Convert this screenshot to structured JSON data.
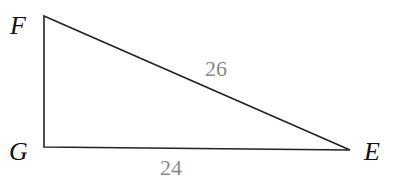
{
  "diagram": {
    "type": "right-triangle",
    "vertices": {
      "F": "F",
      "G": "G",
      "E": "E"
    },
    "right_angle_at": "G",
    "sides": {
      "FE": "26",
      "GE": "24"
    },
    "colors": {
      "line": "#222222",
      "vertex_label": "#111111",
      "side_label": "#888888"
    }
  }
}
